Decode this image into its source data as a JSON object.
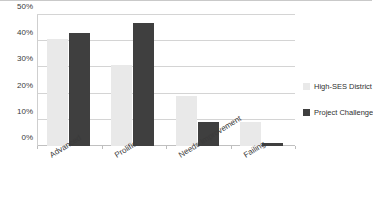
{
  "chart_data": {
    "type": "bar",
    "title": "",
    "subtitle": "",
    "xlabel": "",
    "ylabel": "",
    "categories": [
      "Advanced",
      "Prolific",
      "Needs Improvement",
      "Failing"
    ],
    "series": [
      {
        "name": "High-SES District",
        "color": "#e9e9e9",
        "values": [
          41,
          31,
          19,
          9
        ]
      },
      {
        "name": "Project Challenge",
        "color": "#3f3f3f",
        "values": [
          43,
          47,
          9,
          1
        ]
      }
    ],
    "ylim": [
      0,
      50
    ],
    "y_ticks": [
      "0%",
      "10%",
      "20%",
      "30%",
      "40%",
      "50%"
    ],
    "y_tick_values": [
      0,
      10,
      20,
      30,
      40,
      50
    ],
    "grid": true,
    "legend_position": "right",
    "value_format": "percent"
  },
  "legend": {
    "entries": [
      {
        "label": "High-SES District"
      },
      {
        "label": "Project Challenge"
      }
    ]
  }
}
